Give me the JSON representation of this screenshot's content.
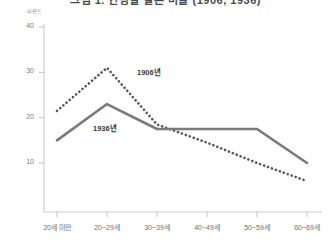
{
  "chart_data": {
    "type": "line",
    "title": "그림 1. 연령별 결혼 비율 (1906, 1936)",
    "ylabel": "퍼센트",
    "xlabel": "",
    "categories": [
      "20세 미만",
      "20~29세",
      "30~39세",
      "40~49세",
      "50~59세",
      "60~69세"
    ],
    "series": [
      {
        "name": "1906년",
        "style": "dotted",
        "color": "#55555a",
        "values": [
          21.5,
          31.0,
          18.5,
          14.5,
          10.0,
          6.0
        ]
      },
      {
        "name": "1936년",
        "style": "solid",
        "color": "#7a7a7e",
        "values": [
          15.0,
          23.0,
          17.5,
          17.5,
          17.5,
          10.0
        ]
      }
    ],
    "ylim": [
      0,
      40
    ],
    "yticks": [
      "40",
      "30",
      "20",
      "10"
    ],
    "ytick_values": [
      40,
      30,
      20,
      10
    ],
    "grid": false,
    "legend_position": "inline-annotation"
  },
  "axis": {
    "y_label_text": "퍼센트",
    "tick_color": "#b5b5b5",
    "axis_color": "#c8c8c8"
  },
  "annotations": [
    {
      "label": "1906년"
    },
    {
      "label": "1936년"
    }
  ]
}
